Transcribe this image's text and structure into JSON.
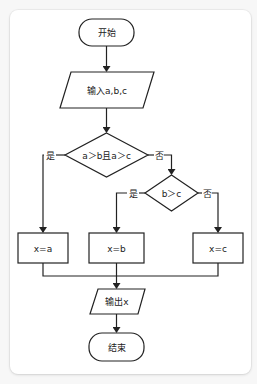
{
  "flowchart": {
    "start": {
      "label": "开始"
    },
    "input": {
      "label": "输入a,b,c"
    },
    "decision1": {
      "label": "a＞b且a＞c",
      "yes": "是",
      "no": "否"
    },
    "decision2": {
      "label": "b＞c",
      "yes": "是",
      "no": "否"
    },
    "assign_a": {
      "label": "x=a"
    },
    "assign_b": {
      "label": "x=b"
    },
    "assign_c": {
      "label": "x=c"
    },
    "output": {
      "label": "输出x"
    },
    "end": {
      "label": "结束"
    }
  },
  "colors": {
    "stroke": "#222222",
    "fill": "#ffffff",
    "page_bg": "#f7f7f7"
  }
}
